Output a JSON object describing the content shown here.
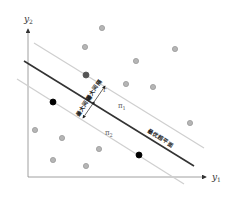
{
  "diagram": {
    "type": "svm-max-margin-hyperplane",
    "axes": {
      "x_label": "y",
      "x_label_sub": "1",
      "y_label": "y",
      "y_label_sub": "2"
    },
    "hyperplane": {
      "label": "最优超平面",
      "color": "#333333"
    },
    "margins": [
      {
        "id": "pi1",
        "label": "π",
        "label_sub": "1",
        "color": "#cfcfcf"
      },
      {
        "id": "pi2",
        "label": "π",
        "label_sub": "2",
        "color": "#cfcfcf"
      }
    ],
    "margin_arrow": {
      "label_upper": "最大间隔",
      "label_lower": "最大间隔",
      "upper_tag": "r",
      "lower_tag": "r"
    },
    "points": {
      "gray": [
        [
          102,
          28
        ],
        [
          85,
          47
        ],
        [
          175,
          49
        ],
        [
          136,
          61
        ],
        [
          126,
          84
        ],
        [
          153,
          87
        ],
        [
          190,
          123
        ],
        [
          35,
          130
        ],
        [
          62,
          138
        ],
        [
          99,
          149
        ],
        [
          53,
          160
        ],
        [
          86,
          166
        ]
      ],
      "dark_gray": [
        [
          86,
          75
        ]
      ],
      "black": [
        [
          53,
          102
        ],
        [
          139,
          155
        ]
      ],
      "colors": {
        "gray": "#b5b5b5",
        "gray_stroke": "#9a9a9a",
        "dark_gray": "#555555",
        "black": "#000000"
      }
    }
  }
}
